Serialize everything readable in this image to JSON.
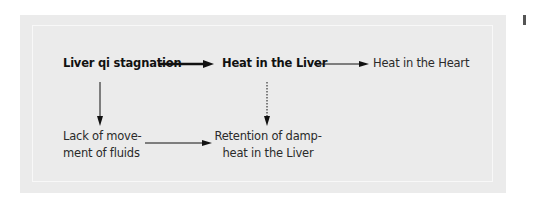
{
  "diagram": {
    "nodes": {
      "liver_qi": "Liver qi stagnation",
      "heat_liver": "Heat in the Liver",
      "heat_heart": "Heat in the Heart",
      "lack_fluids_line1": "Lack of move-",
      "lack_fluids_line2": "ment of fluids",
      "retention_line1": "Retention of damp-",
      "retention_line2": "heat in the Liver"
    },
    "edges": [
      {
        "from": "Liver qi stagnation",
        "to": "Heat in the Liver",
        "style": "thick-solid"
      },
      {
        "from": "Heat in the Liver",
        "to": "Heat in the Heart",
        "style": "thin-solid"
      },
      {
        "from": "Liver qi stagnation",
        "to": "Lack of movement of fluids",
        "style": "thin-solid"
      },
      {
        "from": "Heat in the Liver",
        "to": "Retention of damp-heat in the Liver",
        "style": "dotted"
      },
      {
        "from": "Lack of movement of fluids",
        "to": "Retention of damp-heat in the Liver",
        "style": "thin-solid"
      }
    ],
    "colors": {
      "panel_bg": "#ebebeb",
      "text": "#2a2a2a",
      "arrow": "#111111"
    }
  }
}
